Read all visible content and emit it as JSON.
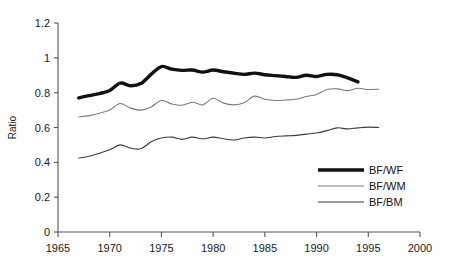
{
  "chart_data": {
    "type": "line",
    "title": "",
    "xlabel": "",
    "ylabel": "Ratio",
    "xlim": [
      1965,
      2000
    ],
    "ylim": [
      0,
      1.2
    ],
    "grid": false,
    "legend_position": "bottom-right",
    "xticks": [
      "1965",
      "1970",
      "1975",
      "1980",
      "1985",
      "1990",
      "1995",
      "2000"
    ],
    "xtick_values": [
      1965,
      1970,
      1975,
      1980,
      1985,
      1990,
      1995,
      2000
    ],
    "yticks": [
      "0",
      "0.2",
      "0.4",
      "0.6",
      "0.8",
      "1",
      "1.2"
    ],
    "ytick_values": [
      0,
      0.2,
      0.4,
      0.6,
      0.8,
      1,
      1.2
    ],
    "series": [
      {
        "name": "BF/WF",
        "style": "thick-black",
        "color": "#111111",
        "width": 3.4,
        "x": [
          1967,
          1968,
          1969,
          1970,
          1971,
          1972,
          1973,
          1974,
          1975,
          1976,
          1977,
          1978,
          1979,
          1980,
          1981,
          1982,
          1983,
          1984,
          1985,
          1986,
          1987,
          1988,
          1989,
          1990,
          1991,
          1992,
          1993,
          1994
        ],
        "values": [
          0.77,
          0.783,
          0.795,
          0.812,
          0.855,
          0.84,
          0.852,
          0.905,
          0.95,
          0.935,
          0.928,
          0.93,
          0.918,
          0.93,
          0.92,
          0.912,
          0.905,
          0.912,
          0.903,
          0.898,
          0.893,
          0.888,
          0.9,
          0.893,
          0.905,
          0.903,
          0.885,
          0.862
        ]
      },
      {
        "name": "BF/WM",
        "style": "thin-gray",
        "color": "#7a7a7a",
        "width": 1.1,
        "x": [
          1967,
          1968,
          1969,
          1970,
          1971,
          1972,
          1973,
          1974,
          1975,
          1976,
          1977,
          1978,
          1979,
          1980,
          1981,
          1982,
          1983,
          1984,
          1985,
          1986,
          1987,
          1988,
          1989,
          1990,
          1991,
          1992,
          1993,
          1994,
          1995,
          1996
        ],
        "values": [
          0.66,
          0.668,
          0.682,
          0.7,
          0.738,
          0.712,
          0.7,
          0.718,
          0.755,
          0.735,
          0.728,
          0.745,
          0.73,
          0.768,
          0.74,
          0.73,
          0.742,
          0.78,
          0.762,
          0.755,
          0.758,
          0.762,
          0.778,
          0.79,
          0.818,
          0.822,
          0.812,
          0.825,
          0.818,
          0.82
        ]
      },
      {
        "name": "BF/BM",
        "style": "thin-black",
        "color": "#3a3a3a",
        "width": 1.1,
        "x": [
          1967,
          1968,
          1969,
          1970,
          1971,
          1972,
          1973,
          1974,
          1975,
          1976,
          1977,
          1978,
          1979,
          1980,
          1981,
          1982,
          1983,
          1984,
          1985,
          1986,
          1987,
          1988,
          1989,
          1990,
          1991,
          1992,
          1993,
          1994,
          1995,
          1996
        ],
        "values": [
          0.425,
          0.435,
          0.452,
          0.472,
          0.5,
          0.482,
          0.478,
          0.518,
          0.54,
          0.545,
          0.532,
          0.545,
          0.535,
          0.545,
          0.535,
          0.528,
          0.54,
          0.545,
          0.54,
          0.548,
          0.552,
          0.555,
          0.562,
          0.568,
          0.582,
          0.598,
          0.592,
          0.598,
          0.602,
          0.6
        ]
      }
    ],
    "legend": [
      {
        "label": "BF/WF"
      },
      {
        "label": "BF/WM"
      },
      {
        "label": "BF/BM"
      }
    ]
  }
}
